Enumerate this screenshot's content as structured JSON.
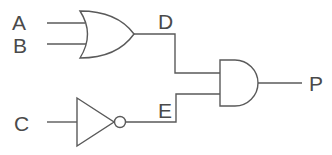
{
  "diagram": {
    "type": "logic-circuit",
    "inputs": [
      {
        "label": "A"
      },
      {
        "label": "B"
      },
      {
        "label": "C"
      }
    ],
    "intermediates": [
      {
        "label": "D",
        "source_gate": "OR",
        "source_inputs": [
          "A",
          "B"
        ]
      },
      {
        "label": "E",
        "source_gate": "NOT",
        "source_inputs": [
          "C"
        ]
      }
    ],
    "output": {
      "label": "P",
      "source_gate": "AND",
      "source_inputs": [
        "D",
        "E"
      ]
    },
    "gates": [
      {
        "type": "OR",
        "inputs": [
          "A",
          "B"
        ],
        "output": "D"
      },
      {
        "type": "NOT",
        "inputs": [
          "C"
        ],
        "output": "E"
      },
      {
        "type": "AND",
        "inputs": [
          "D",
          "E"
        ],
        "output": "P"
      }
    ],
    "colors": {
      "line": "#5a5a5a",
      "text": "#4a4a4a",
      "background": "#ffffff"
    }
  },
  "labels": {
    "a": "A",
    "b": "B",
    "c": "C",
    "d": "D",
    "e": "E",
    "p": "P"
  }
}
